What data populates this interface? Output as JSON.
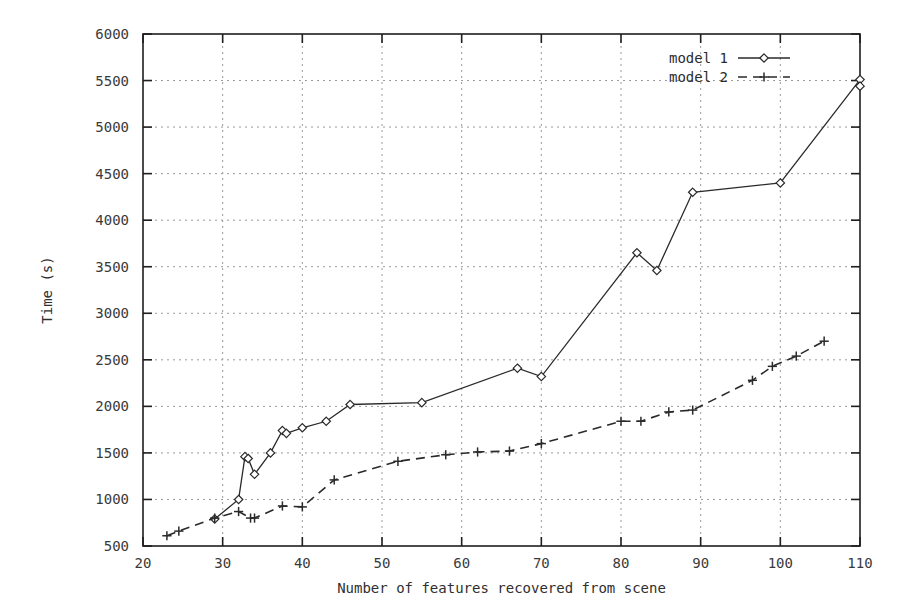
{
  "chart_data": {
    "type": "line",
    "title": "",
    "xlabel": "Number of features recovered from scene",
    "ylabel": "Time (s)",
    "xlim": [
      20,
      110
    ],
    "ylim": [
      500,
      6000
    ],
    "xticks": [
      20,
      30,
      40,
      50,
      60,
      70,
      80,
      90,
      100,
      110
    ],
    "yticks": [
      500,
      1000,
      1500,
      2000,
      2500,
      3000,
      3500,
      4000,
      4500,
      5000,
      5500,
      6000
    ],
    "grid": true,
    "legend_position": "top-right",
    "series": [
      {
        "name": "model 1",
        "marker": "diamond",
        "linestyle": "solid",
        "color": "#2a2a2a",
        "points": [
          [
            29,
            790
          ],
          [
            32,
            1000
          ],
          [
            32.8,
            1460
          ],
          [
            33.2,
            1440
          ],
          [
            34,
            1270
          ],
          [
            36,
            1500
          ],
          [
            37.5,
            1740
          ],
          [
            38,
            1710
          ],
          [
            40,
            1770
          ],
          [
            43,
            1840
          ],
          [
            46,
            2020
          ],
          [
            55,
            2040
          ],
          [
            67,
            2410
          ],
          [
            70,
            2320
          ],
          [
            82,
            3650
          ],
          [
            84.5,
            3460
          ],
          [
            89,
            4300
          ],
          [
            100,
            4400
          ],
          [
            110,
            5510
          ],
          [
            110,
            5440
          ]
        ]
      },
      {
        "name": "model 2",
        "marker": "plus",
        "linestyle": "dashed",
        "color": "#2a2a2a",
        "points": [
          [
            23,
            610
          ],
          [
            24.5,
            660
          ],
          [
            29,
            800
          ],
          [
            32,
            870
          ],
          [
            33.5,
            800
          ],
          [
            34,
            800
          ],
          [
            37.5,
            930
          ],
          [
            40,
            920
          ],
          [
            44,
            1210
          ],
          [
            52,
            1410
          ],
          [
            58,
            1480
          ],
          [
            62,
            1510
          ],
          [
            66,
            1520
          ],
          [
            70,
            1600
          ],
          [
            80,
            1840
          ],
          [
            82.5,
            1840
          ],
          [
            86,
            1940
          ],
          [
            89,
            1960
          ],
          [
            96.5,
            2280
          ],
          [
            99,
            2430
          ],
          [
            102,
            2540
          ],
          [
            105.5,
            2700
          ]
        ]
      }
    ]
  },
  "legend": {
    "entries": [
      {
        "label": "model 1",
        "marker": "diamond-marker",
        "linestyle": "solid"
      },
      {
        "label": "model 2",
        "marker": "plus-marker",
        "linestyle": "dashed"
      }
    ]
  },
  "axes": {
    "x_tick_labels": [
      "20",
      "30",
      "40",
      "50",
      "60",
      "70",
      "80",
      "90",
      "100",
      "110"
    ],
    "y_tick_labels": [
      "500",
      "1000",
      "1500",
      "2000",
      "2500",
      "3000",
      "3500",
      "4000",
      "4500",
      "5000",
      "5500",
      "6000"
    ],
    "x_title": "Number of features recovered from scene",
    "y_title": "Time (s)"
  }
}
